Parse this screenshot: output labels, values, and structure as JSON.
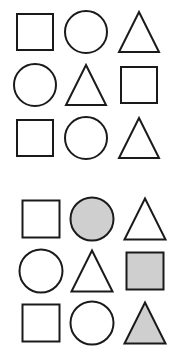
{
  "colors": {
    "stroke": "#1a1a1a",
    "shaded_fill": "#cfcfcf",
    "background": "#ffffff"
  },
  "grids": [
    {
      "name": "top-grid",
      "rows": [
        [
          {
            "shape": "square",
            "shaded": false
          },
          {
            "shape": "circle",
            "shaded": false
          },
          {
            "shape": "triangle",
            "shaded": false
          }
        ],
        [
          {
            "shape": "circle",
            "shaded": false
          },
          {
            "shape": "triangle",
            "shaded": false
          },
          {
            "shape": "square",
            "shaded": false
          }
        ],
        [
          {
            "shape": "square",
            "shaded": false
          },
          {
            "shape": "circle",
            "shaded": false
          },
          {
            "shape": "triangle",
            "shaded": false
          }
        ]
      ]
    },
    {
      "name": "bottom-grid",
      "rows": [
        [
          {
            "shape": "square",
            "shaded": false
          },
          {
            "shape": "circle",
            "shaded": true
          },
          {
            "shape": "triangle",
            "shaded": false
          }
        ],
        [
          {
            "shape": "circle",
            "shaded": false
          },
          {
            "shape": "triangle",
            "shaded": false
          },
          {
            "shape": "square",
            "shaded": true
          }
        ],
        [
          {
            "shape": "square",
            "shaded": false
          },
          {
            "shape": "circle",
            "shaded": false
          },
          {
            "shape": "triangle",
            "shaded": true
          }
        ]
      ]
    }
  ]
}
